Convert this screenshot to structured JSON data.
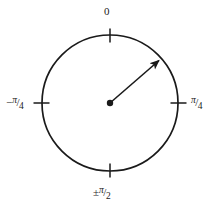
{
  "diagram": {
    "stroke_color": "#1a1a1a",
    "background_color": "#ffffff",
    "circle": {
      "center_x": 110,
      "center_y": 103,
      "radius": 68,
      "stroke_width": 1.7
    },
    "vector": {
      "origin_x": 110,
      "origin_y": 103,
      "tip_x": 162,
      "tip_y": 58,
      "angle_deg_from_top": 49,
      "dot_radius": 3.2,
      "stroke_width": 1.6
    },
    "ticks": [
      {
        "name": "tick-top",
        "position": "top",
        "angle_deg": 0
      },
      {
        "name": "tick-right",
        "position": "right",
        "angle_deg": 90
      },
      {
        "name": "tick-left",
        "position": "left",
        "angle_deg": 270
      },
      {
        "name": "tick-bottom",
        "position": "bottom",
        "angle_deg": 180
      }
    ],
    "labels": {
      "top": {
        "text": "0",
        "value": "0"
      },
      "right": {
        "sign": "",
        "numerator": "π",
        "slash": "/",
        "denominator": "4",
        "value": "π/4"
      },
      "left": {
        "sign": "−",
        "numerator": "π",
        "slash": "/",
        "denominator": "4",
        "value": "−π/4"
      },
      "bottom": {
        "sign": "±",
        "numerator": "π",
        "slash": "/",
        "denominator": "2",
        "value": "±π/2"
      }
    }
  }
}
